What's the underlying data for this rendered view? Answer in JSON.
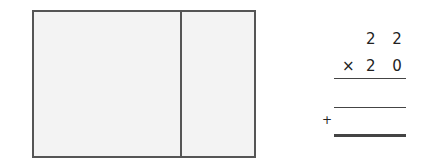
{
  "problem": {
    "multiplicand": "2 2",
    "operator": "×",
    "multiplier": "2 0",
    "plus_sign": "+"
  },
  "area_model": {
    "sections": 2
  }
}
